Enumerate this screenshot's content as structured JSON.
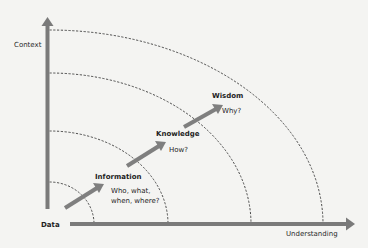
{
  "diagram": {
    "axes": {
      "y_label": "Context",
      "x_label": "Understanding",
      "origin_label": "Data",
      "color": "#7a7a7a"
    },
    "stages": [
      {
        "name": "Information",
        "question": "Who, what,\nwhen, where?"
      },
      {
        "name": "Knowledge",
        "question": "How?"
      },
      {
        "name": "Wisdom",
        "question": "Why?"
      }
    ],
    "arcs": [
      {
        "y_start": 182,
        "x_end": 94
      },
      {
        "y_start": 131,
        "x_end": 168
      },
      {
        "y_start": 73,
        "x_end": 251
      },
      {
        "y_start": 30,
        "x_end": 323
      }
    ],
    "arrow_color": "#7f7f7f",
    "arc_color": "#3a3a3a"
  }
}
